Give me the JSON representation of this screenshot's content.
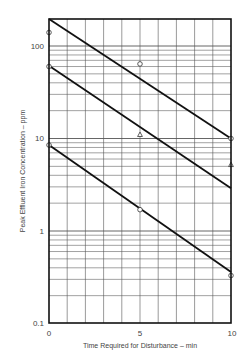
{
  "chart_data": {
    "type": "line",
    "title": "",
    "xlabel": "Time Required for Disturbance – min",
    "ylabel": "Peak Effluent Iron Concentration – ppm",
    "x_scale": "linear",
    "y_scale": "log",
    "xlim": [
      0,
      10
    ],
    "ylim": [
      0.1,
      200
    ],
    "x_ticks": [
      0,
      5,
      10
    ],
    "x_tick_labels": [
      "0",
      "5",
      "10"
    ],
    "y_ticks": [
      0.1,
      1,
      10,
      100
    ],
    "y_tick_labels": [
      "0.1",
      "1",
      "10",
      "100"
    ],
    "grid": true,
    "grid_x_step": 1,
    "grid_y": "log minor (2-9 per decade)",
    "legend": null,
    "series": [
      {
        "name": "Fit line 1 (upper)",
        "kind": "line",
        "x": [
          0,
          10
        ],
        "y": [
          196,
          10
        ]
      },
      {
        "name": "Fit line 2 (middle)",
        "kind": "line",
        "x": [
          0,
          10
        ],
        "y": [
          61,
          2.9
        ]
      },
      {
        "name": "Fit line 3 (lower)",
        "kind": "line",
        "x": [
          0,
          10
        ],
        "y": [
          8.5,
          0.36
        ]
      },
      {
        "name": "Circle markers",
        "kind": "scatter",
        "marker": "circle",
        "x": [
          0,
          0,
          0,
          5,
          5,
          10,
          10
        ],
        "y": [
          140,
          60,
          8.5,
          64,
          1.7,
          10,
          0.33
        ]
      },
      {
        "name": "Triangle markers",
        "kind": "scatter",
        "marker": "triangle",
        "x": [
          5,
          10
        ],
        "y": [
          11,
          5.2
        ]
      }
    ]
  },
  "labels": {
    "xlabel": "Time Required for Disturbance – min",
    "ylabel": "Peak Effluent Iron Concentration – ppm",
    "x0": "0",
    "x5": "5",
    "x10": "10",
    "y01": "0.1",
    "y1": "1",
    "y10": "10",
    "y100": "100"
  }
}
